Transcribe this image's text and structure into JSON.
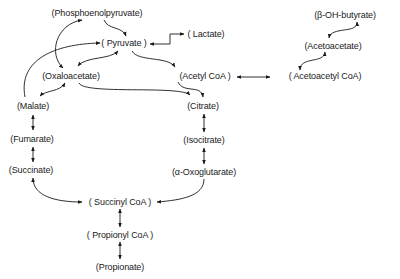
{
  "diagram": {
    "type": "metabolic-pathway",
    "nodes": {
      "pep": {
        "label": "(Phosphoenolpyruvate)",
        "x": 97,
        "y": 8
      },
      "pyruvate": {
        "label": "( Pyruvate )",
        "x": 124,
        "y": 38
      },
      "lactate": {
        "label": "( Lactate)",
        "x": 206,
        "y": 32
      },
      "oxaloacetate": {
        "label": "(Oxaloacetate)",
        "x": 71,
        "y": 71
      },
      "acetylcoa": {
        "label": "(Acetyl CoA )",
        "x": 202,
        "y": 71
      },
      "acetoacetylcoa": {
        "label": "( Acetoacetyl CoA)",
        "x": 324,
        "y": 71
      },
      "acetoacetate": {
        "label": "(Acetoacetate)",
        "x": 333,
        "y": 42
      },
      "bohbutyrate": {
        "label": "(β-OH-butyrate)",
        "x": 345,
        "y": 11
      },
      "malate": {
        "label": "(Malate)",
        "x": 33,
        "y": 101
      },
      "citrate": {
        "label": "(Citrate)",
        "x": 203,
        "y": 101
      },
      "fumarate": {
        "label": "(Fumarate)",
        "x": 32,
        "y": 133
      },
      "isocitrate": {
        "label": "(Isocitrate)",
        "x": 204,
        "y": 135
      },
      "succinate": {
        "label": "(Succinate)",
        "x": 31,
        "y": 165
      },
      "oxoglutarate": {
        "label": "(α-Oxoglutarate)",
        "x": 204,
        "y": 167
      },
      "succinylcoa": {
        "label": "( Succinyl CoA )",
        "x": 120,
        "y": 197
      },
      "propionylcoa": {
        "label": "( Propionyl CoA )",
        "x": 120,
        "y": 230
      },
      "propionate": {
        "label": "(Propionate)",
        "x": 120,
        "y": 262
      }
    },
    "edges": [
      {
        "from": "Phosphoenolpyruvate",
        "to": "Pyruvate",
        "type": "unidirectional"
      },
      {
        "from": "Pyruvate",
        "to": "Lactate",
        "type": "bidirectional"
      },
      {
        "from": "Pyruvate",
        "to": "Oxaloacetate",
        "type": "bidirectional"
      },
      {
        "from": "Pyruvate",
        "to": "Acetyl CoA",
        "type": "unidirectional"
      },
      {
        "from": "Phosphoenolpyruvate",
        "to": "Oxaloacetate",
        "type": "bidirectional"
      },
      {
        "from": "Malate",
        "to": "Pyruvate",
        "type": "unidirectional"
      },
      {
        "from": "Oxaloacetate",
        "to": "Malate",
        "type": "bidirectional"
      },
      {
        "from": "Oxaloacetate",
        "to": "Citrate",
        "type": "unidirectional"
      },
      {
        "from": "Acetyl CoA",
        "to": "Citrate",
        "type": "unidirectional"
      },
      {
        "from": "Acetyl CoA",
        "to": "Acetoacetyl CoA",
        "type": "bidirectional"
      },
      {
        "from": "Acetoacetyl CoA",
        "to": "Acetoacetate",
        "type": "unidirectional"
      },
      {
        "from": "Acetoacetate",
        "to": "β-OH-butyrate",
        "type": "bidirectional"
      },
      {
        "from": "Malate",
        "to": "Fumarate",
        "type": "bidirectional"
      },
      {
        "from": "Fumarate",
        "to": "Succinate",
        "type": "bidirectional"
      },
      {
        "from": "Citrate",
        "to": "Isocitrate",
        "type": "bidirectional"
      },
      {
        "from": "Isocitrate",
        "to": "α-Oxoglutarate",
        "type": "bidirectional"
      },
      {
        "from": "α-Oxoglutarate",
        "to": "Succinyl CoA",
        "type": "unidirectional"
      },
      {
        "from": "Succinyl CoA",
        "to": "Succinate",
        "type": "bidirectional"
      },
      {
        "from": "Succinyl CoA",
        "to": "Propionyl CoA",
        "type": "bidirectional"
      },
      {
        "from": "Propionyl CoA",
        "to": "Propionate",
        "type": "bidirectional"
      }
    ]
  }
}
